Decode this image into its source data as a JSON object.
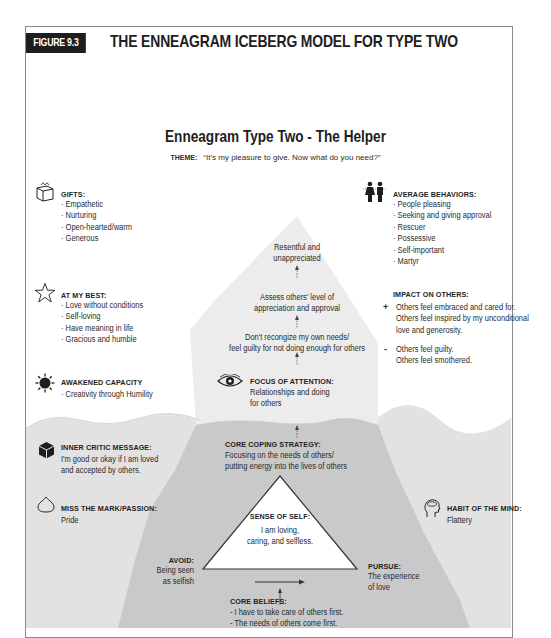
{
  "figure": {
    "tag": "FIGURE 9.3",
    "title": "THE ENNEAGRAM ICEBERG MODEL FOR TYPE TWO"
  },
  "diagram": {
    "title": "Enneagram Type Two - The Helper",
    "theme_label": "THEME:",
    "theme_text": "“It’s my pleasure to give. Now what do you need?”",
    "colors": {
      "above_water_bg": "#ffffff",
      "iceberg_above": "#ebebeb",
      "water": "#e0e0e0",
      "iceberg_below": "#c9c9c9",
      "header_bar": "#1e1e1e"
    },
    "left": {
      "gifts": {
        "icon": "gift-icon",
        "heading": "GIFTS:",
        "items": [
          "Empathetic",
          "Nurturing",
          "Open-hearted/warm",
          "Generous"
        ]
      },
      "at_my_best": {
        "icon": "star-icon",
        "heading": "AT MY BEST:",
        "items": [
          "Love without conditions",
          "Self-loving",
          "Have meaning in life",
          "Gracious and humble"
        ]
      },
      "awakened_capacity": {
        "icon": "sun-icon",
        "heading": "AWAKENED CAPACITY",
        "items": [
          "Creativity through Humility"
        ]
      },
      "inner_critic": {
        "icon": "cube-icon",
        "heading": "INNER CRITIC MESSAGE:",
        "lines": [
          "I'm good or okay if I am loved",
          "and accepted by others."
        ]
      },
      "passion": {
        "icon": "heart-outline-icon",
        "heading": "MISS THE MARK/PASSION:",
        "lines": [
          "Pride"
        ]
      }
    },
    "right": {
      "average_behaviors": {
        "icon": "couple-icon",
        "heading": "AVERAGE BEHAVIORS:",
        "items": [
          "People pleasing",
          "Seeking and giving approval",
          "Rescuer",
          "Possessive",
          "Self-important",
          "Martyr"
        ]
      },
      "impact": {
        "heading": "IMPACT ON OTHERS:",
        "positive_sign": "+",
        "positive": [
          "Others feel embraced and cared for.",
          "Others feel inspired by my unconditional",
          "love and generosity."
        ],
        "negative_sign": "-",
        "negative": [
          "Others feel guilty.",
          "Others feel smothered."
        ]
      },
      "habit": {
        "icon": "head-icon",
        "heading": "HABIT OF THE MIND:",
        "lines": [
          "Flattery"
        ]
      }
    },
    "center": {
      "step1": [
        "Resentful and",
        "unappreciated"
      ],
      "step2": [
        "Assess others' level of",
        "appreciation and approval"
      ],
      "step3": [
        "Don't recongize my own needs/",
        "feel guilty for not doing enough for others"
      ],
      "focus": {
        "icon": "eye-icon",
        "heading": "FOCUS OF ATTENTION:",
        "lines": [
          "Relationships and doing",
          "for others"
        ]
      },
      "coping": {
        "heading": "CORE COPING STRATEGY:",
        "lines": [
          "Focusing on the needs of others/",
          "putting energy into the lives of others"
        ]
      },
      "sense_of_self": {
        "heading": "SENSE OF SELF:",
        "lines": [
          "I am loving,",
          "caring, and selfless."
        ]
      },
      "avoid": {
        "heading": "AVOID:",
        "lines": [
          "Being seen",
          "as selfish"
        ]
      },
      "pursue": {
        "heading": "PURSUE:",
        "lines": [
          "The experience",
          "of love"
        ]
      },
      "core_beliefs": {
        "heading": "CORE BELIEFS:",
        "items": [
          "I have to take care of others first.",
          "The needs of others come first."
        ]
      }
    }
  }
}
